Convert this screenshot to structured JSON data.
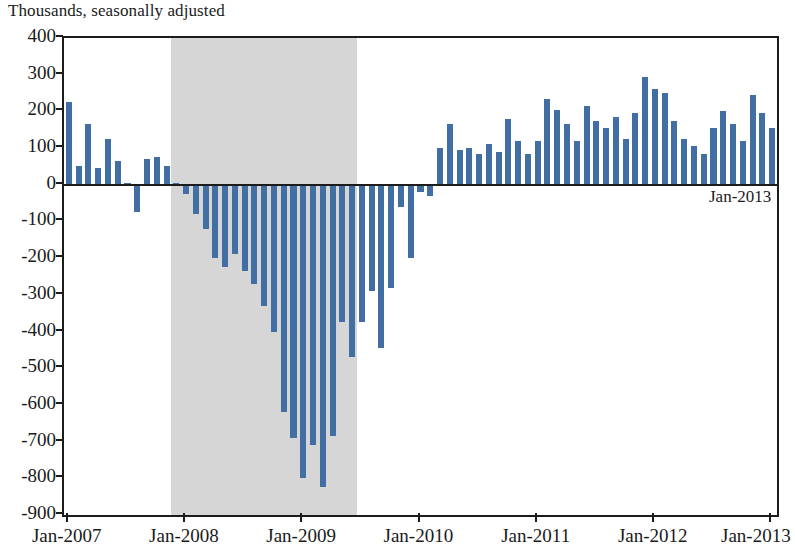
{
  "subtitle": "Thousands, seasonally adjusted",
  "annotation": {
    "label": "Jan-2013"
  },
  "colors": {
    "bar": "#416fa4",
    "recession_shading": "#d4d4d4",
    "axis": "#1c1c1c",
    "text": "#1a1a1a",
    "background": "#ffffff"
  },
  "chart_data": {
    "type": "bar",
    "title": "",
    "subtitle": "Thousands, seasonally adjusted",
    "xlabel": "",
    "ylabel": "",
    "ylim": [
      -900,
      400
    ],
    "ytick_step": 100,
    "yticks": [
      400,
      300,
      200,
      100,
      0,
      -100,
      -200,
      -300,
      -400,
      -500,
      -600,
      -700,
      -800,
      -900
    ],
    "ytick_labels": [
      "400",
      "300",
      "200",
      "100",
      "0",
      "-100",
      "-200",
      "-300",
      "-400",
      "-500",
      "-600",
      "-700",
      "-800",
      "-900"
    ],
    "xtick_labels": [
      "Jan-2007",
      "Jan-2008",
      "Jan-2009",
      "Jan-2010",
      "Jan-2011",
      "Jan-2012",
      "Jan-2013"
    ],
    "xtick_categories": [
      "2007-01",
      "2008-01",
      "2009-01",
      "2010-01",
      "2011-01",
      "2012-01",
      "2013-01"
    ],
    "grid": false,
    "legend": false,
    "bar_color": "#416fa4",
    "shaded_regions": [
      {
        "label": "Recession",
        "start": "2007-12",
        "end": "2009-06",
        "color": "#d4d4d4"
      }
    ],
    "annotations": [
      {
        "text": "Jan-2013",
        "x": "2013-01",
        "y": -40,
        "align": "right"
      }
    ],
    "categories": [
      "2007-01",
      "2007-02",
      "2007-03",
      "2007-04",
      "2007-05",
      "2007-06",
      "2007-07",
      "2007-08",
      "2007-09",
      "2007-10",
      "2007-11",
      "2007-12",
      "2008-01",
      "2008-02",
      "2008-03",
      "2008-04",
      "2008-05",
      "2008-06",
      "2008-07",
      "2008-08",
      "2008-09",
      "2008-10",
      "2008-11",
      "2008-12",
      "2009-01",
      "2009-02",
      "2009-03",
      "2009-04",
      "2009-05",
      "2009-06",
      "2009-07",
      "2009-08",
      "2009-09",
      "2009-10",
      "2009-11",
      "2009-12",
      "2010-01",
      "2010-02",
      "2010-03",
      "2010-04",
      "2010-05",
      "2010-06",
      "2010-07",
      "2010-08",
      "2010-09",
      "2010-10",
      "2010-11",
      "2010-12",
      "2011-01",
      "2011-02",
      "2011-03",
      "2011-04",
      "2011-05",
      "2011-06",
      "2011-07",
      "2011-08",
      "2011-09",
      "2011-10",
      "2011-11",
      "2011-12",
      "2012-01",
      "2012-02",
      "2012-03",
      "2012-04",
      "2012-05",
      "2012-06",
      "2012-07",
      "2012-08",
      "2012-09",
      "2012-10",
      "2012-11",
      "2012-12",
      "2013-01"
    ],
    "values": [
      226,
      52,
      165,
      45,
      125,
      65,
      5,
      -75,
      70,
      75,
      50,
      5,
      -25,
      -80,
      -120,
      -200,
      -225,
      -190,
      -235,
      -270,
      -330,
      -400,
      -620,
      -690,
      -800,
      -710,
      -825,
      -685,
      -375,
      -470,
      -375,
      -290,
      -445,
      -280,
      -60,
      -200,
      -20,
      -30,
      100,
      165,
      95,
      100,
      85,
      110,
      90,
      180,
      120,
      85,
      120,
      235,
      205,
      165,
      120,
      215,
      175,
      155,
      185,
      125,
      195,
      295,
      260,
      250,
      175,
      125,
      105,
      85,
      155,
      200,
      165,
      120,
      245,
      195,
      155
    ],
    "notes": {
      "series_name": "Monthly change in total nonfarm payroll employment",
      "units": "Thousands of jobs, seasonally adjusted",
      "n_points": 73
    }
  }
}
